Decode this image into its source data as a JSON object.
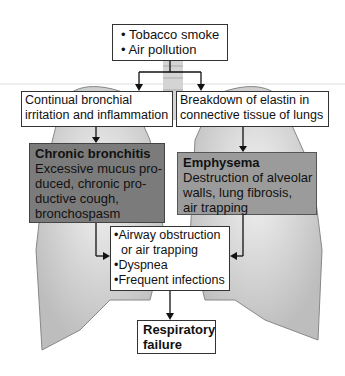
{
  "diagram": {
    "causes": {
      "items": [
        "• Tobacco smoke",
        "• Air pollution"
      ]
    },
    "left_process": {
      "lines": [
        "Continual bronchial",
        "irritation and inflammation"
      ]
    },
    "right_process": {
      "lines": [
        "Breakdown of elastin in",
        "connective tissue of lungs"
      ]
    },
    "bronchitis": {
      "title": "Chronic bronchitis",
      "lines": [
        "Excessive mucus pro-",
        "duced, chronic pro-",
        "ductive cough,",
        "bronchospasm"
      ],
      "color": "#7b7b7b"
    },
    "emphysema": {
      "title": "Emphysema",
      "lines": [
        "Destruction of alveolar",
        "walls, lung fibrosis,",
        "air trapping"
      ],
      "color": "#9b9b9b"
    },
    "symptoms": {
      "lines": [
        "•Airway obstruction",
        "  or air trapping",
        "•Dyspnea",
        "•Frequent infections"
      ]
    },
    "outcome": {
      "lines": [
        "Respiratory",
        "failure"
      ]
    }
  }
}
